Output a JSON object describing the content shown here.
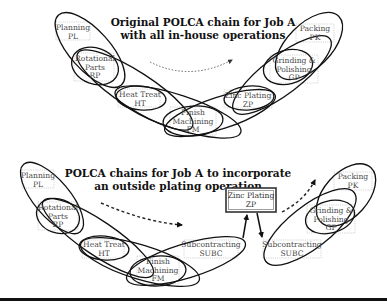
{
  "top_panel": {
    "title_line1": "Original POLCA chain for Job A",
    "title_line2": "with all in-house operations",
    "nodes": {
      "pl": {
        "line1": "Planning",
        "line2": "PL"
      },
      "rp": {
        "line1": "Rotational",
        "line2": "Parts",
        "line3": "RP"
      },
      "ht": {
        "line1": "Heat Treat",
        "line2": "HT"
      },
      "fm": {
        "line1": "Finish",
        "line2": "Machining",
        "line3": "FM"
      },
      "zp": {
        "line1": "Zinc Plating",
        "line2": "ZP"
      },
      "gp": {
        "line1": "Grinding &",
        "line2": "Polishing",
        "line3": "GP"
      },
      "pk": {
        "line1": "Packing",
        "line2": "PK"
      }
    },
    "loops": [
      "PL-RP",
      "RP-HT",
      "HT-FM",
      "FM-ZP",
      "ZP-GP",
      "GP-PK"
    ]
  },
  "bottom_panel": {
    "title_line1": "POLCA chains for Job A to incorporate",
    "title_line2": "an outside plating operation",
    "nodes": {
      "pl": {
        "line1": "Planning",
        "line2": "PL"
      },
      "rp": {
        "line1": "Rotational",
        "line2": "Parts",
        "line3": "RP"
      },
      "ht": {
        "line1": "Heat Treat",
        "line2": "HT"
      },
      "fm": {
        "line1": "Finish",
        "line2": "Machining",
        "line3": "FM"
      },
      "subc1": {
        "line1": "Subcontracting",
        "line2": "SUBC"
      },
      "zp": {
        "line1": "Zinc Plating",
        "line2": "ZP"
      },
      "subc2": {
        "line1": "Subcontracting",
        "line2": "SUBC"
      },
      "gp": {
        "line1": "Grinding &",
        "line2": "Polishing",
        "line3": "GP"
      },
      "pk": {
        "line1": "Packing",
        "line2": "PK"
      }
    },
    "loops": [
      "PL-RP",
      "RP-HT",
      "HT-FM",
      "FM-SUBC",
      "SUBC-GP",
      "GP-PK"
    ]
  },
  "colors": {
    "loop_stroke": "#111111",
    "label_text": "#4a4a4a",
    "box_stroke": "#b8b8b8",
    "background": "#ffffff"
  }
}
